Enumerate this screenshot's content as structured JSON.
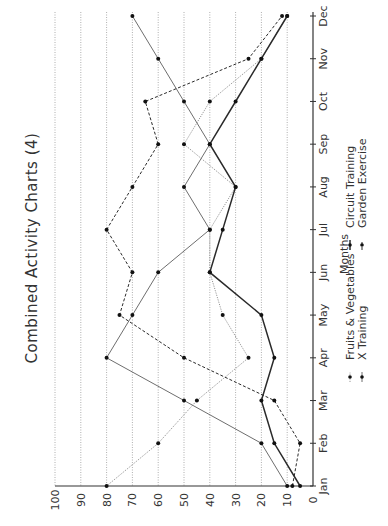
{
  "chart_data": {
    "type": "line",
    "title": "Combined Activity Charts (4)",
    "xlabel": "Months",
    "ylabel": "",
    "orientation": "rotated-90-clockwise",
    "categories": [
      "Jan",
      "Feb",
      "Mar",
      "Apr",
      "May",
      "Jun",
      "Jul",
      "Aug",
      "Sep",
      "Oct",
      "Nov",
      "Dec"
    ],
    "y_ticks": [
      0,
      10,
      20,
      30,
      40,
      50,
      60,
      70,
      80,
      90,
      100
    ],
    "ylim": [
      0,
      100
    ],
    "grid": true,
    "legend_position": "below-axis",
    "series": [
      {
        "name": "Fruits & Vegetables",
        "style": "dotted",
        "color": "#8a8a8a",
        "values": [
          80,
          60,
          45,
          25,
          35,
          40,
          40,
          30,
          50,
          40,
          20,
          10
        ]
      },
      {
        "name": "X Training",
        "style": "solid-light",
        "color": "#7a7a7a",
        "values": [
          10,
          20,
          50,
          80,
          70,
          60,
          40,
          50,
          40,
          50,
          60,
          70
        ]
      },
      {
        "name": "Circuit Training",
        "style": "solid-dark",
        "color": "#333333",
        "values": [
          5,
          15,
          20,
          15,
          20,
          40,
          35,
          30,
          40,
          30,
          20,
          10
        ]
      },
      {
        "name": "Garden Exercise",
        "style": "dashed",
        "color": "#333333",
        "values": [
          8,
          5,
          15,
          50,
          75,
          70,
          80,
          70,
          60,
          65,
          25,
          12
        ]
      }
    ]
  }
}
